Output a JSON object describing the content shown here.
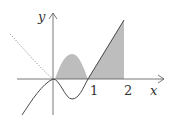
{
  "figure": {
    "labels": {
      "y_axis": "y",
      "x_axis": "x",
      "tick_1": "1",
      "tick_2": "2"
    },
    "colors": {
      "axis": "#555555",
      "curve": "#333333",
      "dotted_curve": "#888888",
      "shade": "#bdbdbd"
    }
  }
}
